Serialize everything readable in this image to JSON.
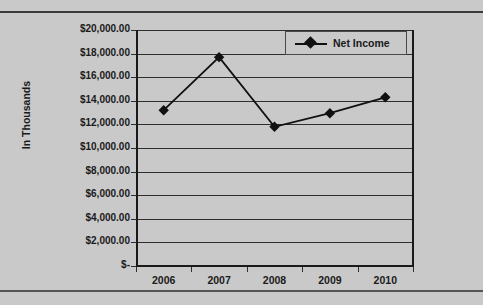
{
  "chart_data": {
    "type": "line",
    "title": "",
    "xlabel": "",
    "ylabel": "In Thousands",
    "categories": [
      "2006",
      "2007",
      "2008",
      "2009",
      "2010"
    ],
    "series": [
      {
        "name": "Net Income",
        "values": [
          13200,
          17700,
          11800,
          12950,
          14300
        ],
        "marker": "diamond",
        "color": "#111111"
      }
    ],
    "ylim": [
      0,
      20000
    ],
    "ytick_values": [
      0,
      2000,
      4000,
      6000,
      8000,
      10000,
      12000,
      14000,
      16000,
      18000,
      20000
    ],
    "ytick_labels": [
      "$-",
      "$2,000.00",
      "$4,000.00",
      "$6,000.00",
      "$8,000.00",
      "$10,000.00",
      "$12,000.00",
      "$14,000.00",
      "$16,000.00",
      "$18,000.00",
      "$20,000.00"
    ],
    "grid": true,
    "legend": [
      "Net Income"
    ],
    "legend_position": "top-right",
    "plot_background": "#c9c9c9",
    "gridline_color": "#2e2e2e",
    "axis_color": "#1a1a1a"
  }
}
